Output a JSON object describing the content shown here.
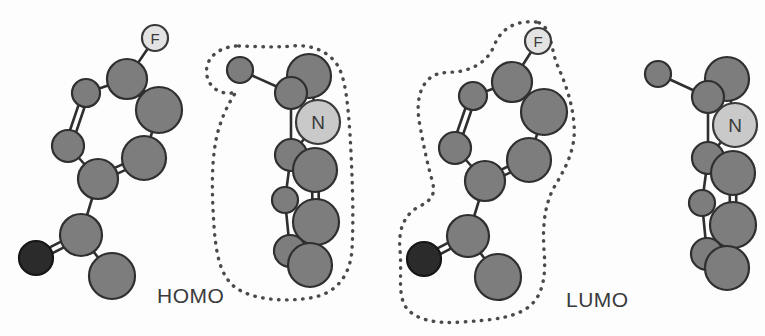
{
  "figure": {
    "background_color": "#fdfdfd",
    "panels": [
      {
        "id": "homo",
        "label": "HOMO",
        "label_x": 157,
        "label_y": 284,
        "outline_on_fragment": "heterocycle",
        "description": "Frontier molecular orbital isosurface outline localized on the nitrogen heterocycle fragment"
      },
      {
        "id": "lumo",
        "label": "LUMO",
        "label_x": 566,
        "label_y": 288,
        "outline_on_fragment": "fluoroaryl-ketone",
        "description": "Frontier molecular orbital isosurface outline localized on the fluorinated aryl ketone fragment"
      }
    ]
  },
  "colors": {
    "carbon": "#7d7d7d",
    "carbon_stroke": "#2f2f2f",
    "oxygen": "#2b2b2b",
    "oxygen_stroke": "#161616",
    "fluorine": "#e3e3e3",
    "fluorine_stroke": "#3a3a3a",
    "nitrogen": "#c9c9c9",
    "nitrogen_stroke": "#3a3a3a",
    "bond": "#2f2f2f",
    "contour_dots": "#4a4a4a",
    "label_text": "#3b3b3b",
    "background": "#fdfdfd"
  },
  "atom_labels": {
    "fluorine": "F",
    "nitrogen": "N"
  },
  "chart_data": {
    "type": "scatter",
    "title": "",
    "xlabel": "",
    "ylabel": "",
    "legend": [
      "HOMO",
      "LUMO"
    ],
    "molecules": [
      {
        "panel": "homo",
        "fragment": "fluoroaryl-ketone",
        "has_contour": false,
        "atoms": [
          {
            "id": "F1",
            "element": "F",
            "label": "F",
            "x": 155,
            "y": 38,
            "r": 13
          },
          {
            "id": "C1",
            "element": "C",
            "x": 127,
            "y": 79,
            "r": 20
          },
          {
            "id": "C2",
            "element": "C",
            "x": 86,
            "y": 93,
            "r": 14
          },
          {
            "id": "C3",
            "element": "C",
            "x": 159,
            "y": 110,
            "r": 23
          },
          {
            "id": "C4",
            "element": "C",
            "x": 68,
            "y": 146,
            "r": 16
          },
          {
            "id": "C5",
            "element": "C",
            "x": 144,
            "y": 158,
            "r": 22
          },
          {
            "id": "C6",
            "element": "C",
            "x": 98,
            "y": 179,
            "r": 20
          },
          {
            "id": "C7",
            "element": "C",
            "x": 81,
            "y": 235,
            "r": 21
          },
          {
            "id": "O1",
            "element": "O",
            "x": 36,
            "y": 258,
            "r": 17
          },
          {
            "id": "C8",
            "element": "C",
            "x": 112,
            "y": 276,
            "r": 23
          }
        ],
        "bonds": [
          {
            "a": "F1",
            "b": "C1",
            "order": 1
          },
          {
            "a": "C1",
            "b": "C2",
            "order": 1
          },
          {
            "a": "C1",
            "b": "C3",
            "order": 2
          },
          {
            "a": "C2",
            "b": "C4",
            "order": 2
          },
          {
            "a": "C3",
            "b": "C5",
            "order": 1
          },
          {
            "a": "C4",
            "b": "C6",
            "order": 1
          },
          {
            "a": "C5",
            "b": "C6",
            "order": 2
          },
          {
            "a": "C6",
            "b": "C7",
            "order": 1
          },
          {
            "a": "C7",
            "b": "O1",
            "order": 2
          },
          {
            "a": "C7",
            "b": "C8",
            "order": 1
          }
        ]
      },
      {
        "panel": "homo",
        "fragment": "heterocycle",
        "has_contour": true,
        "atoms": [
          {
            "id": "C9",
            "element": "C",
            "x": 240,
            "y": 70,
            "r": 13
          },
          {
            "id": "C10",
            "element": "C",
            "x": 291,
            "y": 93,
            "r": 16
          },
          {
            "id": "C11",
            "element": "C",
            "x": 309,
            "y": 76,
            "r": 22
          },
          {
            "id": "N1",
            "element": "N",
            "x": 318,
            "y": 122,
            "r": 22
          },
          {
            "id": "C12",
            "element": "C",
            "x": 291,
            "y": 155,
            "r": 16
          },
          {
            "id": "C13",
            "element": "C",
            "x": 315,
            "y": 170,
            "r": 22
          },
          {
            "id": "C14",
            "element": "C",
            "x": 285,
            "y": 200,
            "r": 13
          },
          {
            "id": "C15",
            "element": "C",
            "x": 316,
            "y": 222,
            "r": 23
          },
          {
            "id": "C16",
            "element": "C",
            "x": 290,
            "y": 251,
            "r": 16
          },
          {
            "id": "C17",
            "element": "C",
            "x": 310,
            "y": 265,
            "r": 22
          }
        ],
        "bonds": [
          {
            "a": "C9",
            "b": "C10",
            "order": 1
          },
          {
            "a": "C10",
            "b": "C11",
            "order": 2
          },
          {
            "a": "C11",
            "b": "N1",
            "order": 1
          },
          {
            "a": "N1",
            "b": "C12",
            "order": 1
          },
          {
            "a": "C10",
            "b": "C12",
            "order": 1
          },
          {
            "a": "C12",
            "b": "C13",
            "order": 2
          },
          {
            "a": "C12",
            "b": "C14",
            "order": 1
          },
          {
            "a": "C13",
            "b": "C15",
            "order": 2
          },
          {
            "a": "C14",
            "b": "C16",
            "order": 1
          },
          {
            "a": "C15",
            "b": "C17",
            "order": 1
          },
          {
            "a": "C16",
            "b": "C17",
            "order": 2
          }
        ],
        "contour": "M 236,46 C 214,48 204,62 207,76 C 210,90 224,96 236,92 C 228,104 220,120 216,140 C 211,166 212,196 214,226 C 216,254 220,276 236,288 C 254,300 284,302 310,298 C 336,294 350,276 352,250 C 354,214 352,170 350,134 C 348,106 346,84 340,70 C 332,52 312,44 292,46 C 272,48 254,46 236,46 Z"
      },
      {
        "panel": "lumo",
        "fragment": "fluoroaryl-ketone",
        "has_contour": true,
        "atoms": [
          {
            "id": "F1",
            "element": "F",
            "label": "F",
            "x": 538,
            "y": 41,
            "r": 13
          },
          {
            "id": "C1",
            "element": "C",
            "x": 512,
            "y": 82,
            "r": 20
          },
          {
            "id": "C2",
            "element": "C",
            "x": 473,
            "y": 96,
            "r": 14
          },
          {
            "id": "C3",
            "element": "C",
            "x": 544,
            "y": 112,
            "r": 23
          },
          {
            "id": "C4",
            "element": "C",
            "x": 455,
            "y": 148,
            "r": 16
          },
          {
            "id": "C5",
            "element": "C",
            "x": 529,
            "y": 160,
            "r": 22
          },
          {
            "id": "C6",
            "element": "C",
            "x": 485,
            "y": 181,
            "r": 20
          },
          {
            "id": "C7",
            "element": "C",
            "x": 468,
            "y": 236,
            "r": 21
          },
          {
            "id": "O1",
            "element": "O",
            "x": 424,
            "y": 259,
            "r": 17
          },
          {
            "id": "C8",
            "element": "C",
            "x": 498,
            "y": 277,
            "r": 23
          }
        ],
        "bonds": [
          {
            "a": "F1",
            "b": "C1",
            "order": 1
          },
          {
            "a": "C1",
            "b": "C2",
            "order": 1
          },
          {
            "a": "C1",
            "b": "C3",
            "order": 2
          },
          {
            "a": "C2",
            "b": "C4",
            "order": 2
          },
          {
            "a": "C3",
            "b": "C5",
            "order": 1
          },
          {
            "a": "C4",
            "b": "C6",
            "order": 1
          },
          {
            "a": "C5",
            "b": "C6",
            "order": 2
          },
          {
            "a": "C6",
            "b": "C7",
            "order": 1
          },
          {
            "a": "C7",
            "b": "O1",
            "order": 2
          },
          {
            "a": "C7",
            "b": "C8",
            "order": 1
          }
        ],
        "contour": "M 536,22 C 514,20 500,30 494,46 C 488,60 478,66 466,70 C 452,74 440,70 430,78 C 418,88 416,106 420,126 C 424,148 428,166 432,180 C 436,194 432,200 420,206 C 404,214 398,230 400,250 C 402,272 398,290 404,304 C 412,320 436,324 462,322 C 492,320 518,318 532,304 C 544,292 546,272 544,250 C 542,222 546,200 556,184 C 568,164 576,146 574,124 C 572,100 564,80 556,62 C 550,42 550,24 536,22 Z"
      },
      {
        "panel": "lumo",
        "fragment": "heterocycle",
        "has_contour": false,
        "atoms": [
          {
            "id": "C9",
            "element": "C",
            "x": 658,
            "y": 74,
            "r": 13
          },
          {
            "id": "C10",
            "element": "C",
            "x": 708,
            "y": 97,
            "r": 16
          },
          {
            "id": "C11",
            "element": "C",
            "x": 727,
            "y": 79,
            "r": 22
          },
          {
            "id": "N1",
            "element": "N",
            "x": 735,
            "y": 125,
            "r": 22
          },
          {
            "id": "C12",
            "element": "C",
            "x": 708,
            "y": 158,
            "r": 16
          },
          {
            "id": "C13",
            "element": "C",
            "x": 733,
            "y": 173,
            "r": 22
          },
          {
            "id": "C14",
            "element": "C",
            "x": 702,
            "y": 203,
            "r": 13
          },
          {
            "id": "C15",
            "element": "C",
            "x": 733,
            "y": 225,
            "r": 23
          },
          {
            "id": "C16",
            "element": "C",
            "x": 707,
            "y": 254,
            "r": 16
          },
          {
            "id": "C17",
            "element": "C",
            "x": 727,
            "y": 268,
            "r": 22
          }
        ],
        "bonds": [
          {
            "a": "C9",
            "b": "C10",
            "order": 1
          },
          {
            "a": "C10",
            "b": "C11",
            "order": 2
          },
          {
            "a": "C11",
            "b": "N1",
            "order": 1
          },
          {
            "a": "N1",
            "b": "C12",
            "order": 1
          },
          {
            "a": "C10",
            "b": "C12",
            "order": 1
          },
          {
            "a": "C12",
            "b": "C13",
            "order": 2
          },
          {
            "a": "C12",
            "b": "C14",
            "order": 1
          },
          {
            "a": "C13",
            "b": "C15",
            "order": 2
          },
          {
            "a": "C14",
            "b": "C16",
            "order": 1
          },
          {
            "a": "C15",
            "b": "C17",
            "order": 1
          },
          {
            "a": "C16",
            "b": "C17",
            "order": 2
          }
        ]
      }
    ]
  }
}
